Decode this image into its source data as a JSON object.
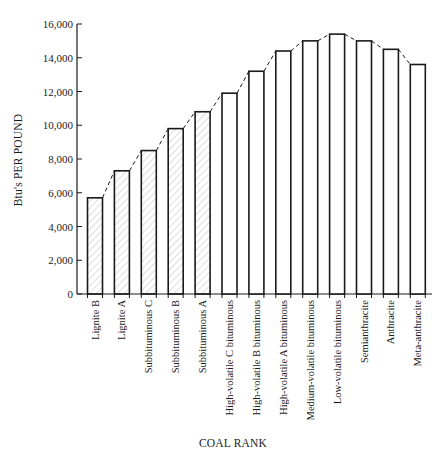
{
  "chart_data": {
    "type": "bar",
    "title": "",
    "xlabel": "COAL RANK",
    "ylabel": "Btu's PER POUND",
    "ylim": [
      0,
      16000
    ],
    "yticks": [
      0,
      2000,
      4000,
      6000,
      8000,
      10000,
      12000,
      14000,
      16000
    ],
    "ytick_labels": [
      "0",
      "2,000",
      "4,000",
      "6,000",
      "8,000",
      "10,000",
      "12,000",
      "14,000",
      "16,000"
    ],
    "grid": false,
    "legend": null,
    "categories": [
      "Lignite B",
      "Lignite A",
      "Subbituminous C",
      "Subbituminous B",
      "Subbituminous A",
      "High-volatile C bituminous",
      "High-volatile B bituminous",
      "High-volatile A bituminous",
      "Medium-volatile bituminous",
      "Low-volatile bituminous",
      "Semianthracite",
      "Anthracite",
      "Meta-anthracite"
    ],
    "values": [
      5700,
      7300,
      8500,
      9800,
      10800,
      11900,
      13200,
      14400,
      15000,
      15400,
      15000,
      14500,
      13600
    ],
    "annotations": [
      "dashed trend line connecting bar tops",
      "hatched fill on lignite and subbituminous bars"
    ],
    "hatched_count": 5
  },
  "colors": {
    "ink": "#1a1a1a",
    "hatch": "#b8b8b8",
    "background": "#ffffff"
  }
}
